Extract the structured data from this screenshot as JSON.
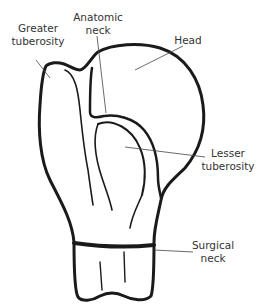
{
  "colors": {
    "outline": "#1a1a1a",
    "leader": "#444444",
    "text": "#333333",
    "background": "#ffffff"
  },
  "labels": {
    "greater_tuberosity": {
      "line1": "Greater",
      "line2": "tuberosity"
    },
    "anatomic_neck": {
      "line1": "Anatomic",
      "line2": "neck"
    },
    "head": {
      "line1": "Head"
    },
    "lesser_tuberosity": {
      "line1": "Lesser",
      "line2": "tuberosity"
    },
    "surgical_neck": {
      "line1": "Surgical",
      "line2": "neck"
    }
  }
}
